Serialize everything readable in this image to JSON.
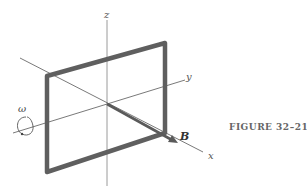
{
  "figure": {
    "caption": "FIGURE 32–21",
    "labels": {
      "z_axis": "z",
      "y_axis": "y",
      "x_axis": "x",
      "field_vector": "B",
      "angular_velocity": "ω"
    },
    "colors": {
      "loop": "#5f5f5f",
      "axis": "#6a6a6a",
      "z_axis": "#9a9a9a",
      "vector": "#5a5a5a",
      "caption": "#666666"
    }
  }
}
